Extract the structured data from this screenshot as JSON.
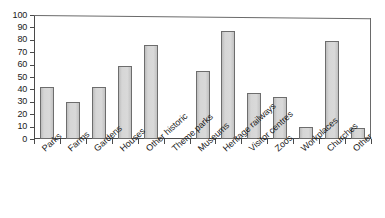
{
  "chart_data": {
    "type": "bar",
    "title": "",
    "subtitle": "",
    "xlabel": "",
    "ylabel": "",
    "ylim": [
      0,
      100
    ],
    "ytick_step": 10,
    "yticks": [
      100,
      90,
      80,
      70,
      60,
      50,
      40,
      30,
      20,
      10,
      0
    ],
    "grid": false,
    "legend": false,
    "legend_position": "none",
    "categories": [
      "Parks",
      "Farms",
      "Gardens",
      "Houses",
      "Other historic",
      "Theme parks",
      "Museums",
      "Heritage railways",
      "Visitor centres",
      "Zoos",
      "Workplaces",
      "Churches",
      "Other"
    ],
    "values": [
      42,
      30,
      42,
      59,
      76,
      0,
      55,
      87,
      37,
      34,
      10,
      79,
      9
    ],
    "series": [
      {
        "name": "",
        "values": [
          42,
          30,
          42,
          59,
          76,
          0,
          55,
          87,
          37,
          34,
          10,
          79,
          9
        ]
      }
    ]
  },
  "style": {
    "bar_fill": "#d4d4d4",
    "bar_border": "#6d6d6d",
    "axis_color": "#4a4a4a",
    "frame_color": "#6a6a6a",
    "text_color": "#1a1a1a",
    "background": "#ffffff"
  }
}
